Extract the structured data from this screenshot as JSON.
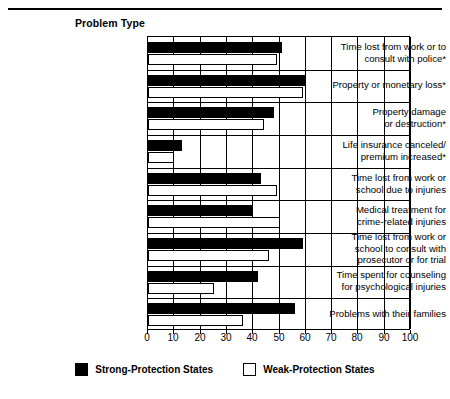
{
  "top_rule_caption": "",
  "header": {
    "axis_title": "Problem Type"
  },
  "legend": {
    "position": "bottom-center",
    "items": [
      {
        "label": "Strong-Protection States",
        "color": "#000000",
        "style": "filled"
      },
      {
        "label": "Weak-Protection States",
        "color": "#ffffff",
        "style": "outlined"
      }
    ]
  },
  "chart_data": {
    "type": "bar",
    "orientation": "horizontal",
    "title": "",
    "subtitle": "",
    "xlabel": "",
    "ylabel": "Problem Type",
    "xlim": [
      0,
      100
    ],
    "xticks": [
      0,
      10,
      20,
      30,
      40,
      50,
      60,
      70,
      80,
      90,
      100
    ],
    "xticklabels": [
      "0",
      "10",
      "20",
      "30",
      "40",
      "50",
      "60",
      "70",
      "80",
      "90",
      "100"
    ],
    "grid": true,
    "grid_axis": "x",
    "legend_position": "bottom-center",
    "categories": [
      "Time lost from work or to\nconsult with police*",
      "Property or monetary loss*",
      "Property damage\nor destruction*",
      "Life insurance canceled/\npremium increased*",
      "Time lost from work or\nschool due to injuries",
      "Medical treatment for\ncrime-related injuries",
      "Time lost from work or\nschool to consult with\nprosecutor or for trial",
      "Time spent for counseling\nfor psychological injuries",
      "Problems with their families"
    ],
    "series": [
      {
        "name": "Strong-Protection States",
        "color": "#000000",
        "values": [
          51,
          60,
          48,
          13,
          43,
          40,
          59,
          42,
          56
        ]
      },
      {
        "name": "Weak-Protection States",
        "color": "#ffffff",
        "values": [
          49,
          59,
          44,
          10,
          49,
          50,
          46,
          25,
          36
        ]
      }
    ]
  }
}
